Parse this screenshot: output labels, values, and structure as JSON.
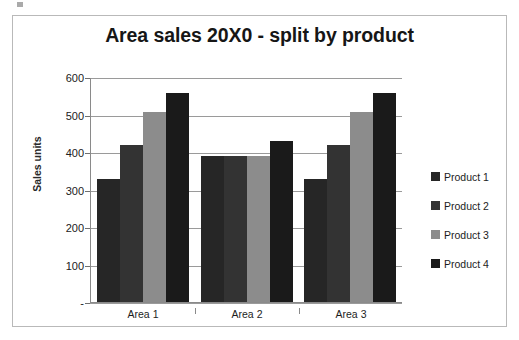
{
  "chart_data": {
    "type": "bar",
    "title": "Area sales 20X0 - split by product",
    "xlabel": "",
    "ylabel": "Sales units",
    "categories": [
      "Area 1",
      "Area 2",
      "Area 3"
    ],
    "series": [
      {
        "name": "Product 1",
        "color": "#262626",
        "values": [
          330,
          390,
          330
        ]
      },
      {
        "name": "Product 2",
        "color": "#333333",
        "values": [
          420,
          390,
          420
        ]
      },
      {
        "name": "Product 3",
        "color": "#8c8c8c",
        "values": [
          510,
          390,
          510
        ]
      },
      {
        "name": "Product 4",
        "color": "#1a1a1a",
        "values": [
          560,
          430,
          560
        ]
      }
    ],
    "ylim": [
      0,
      600
    ],
    "y_ticks": [
      {
        "value": 600,
        "label": "600"
      },
      {
        "value": 500,
        "label": "500"
      },
      {
        "value": 400,
        "label": "400"
      },
      {
        "value": 300,
        "label": "300"
      },
      {
        "value": 200,
        "label": "200"
      },
      {
        "value": 100,
        "label": "100"
      },
      {
        "value": 0,
        "label": "-"
      }
    ],
    "grid": true,
    "legend_position": "right",
    "legend": [
      "Product 1",
      "Product 2",
      "Product 3",
      "Product 4"
    ]
  }
}
